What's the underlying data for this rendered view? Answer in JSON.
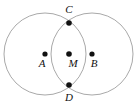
{
  "figure": {
    "background_color": "#ffffff",
    "circle_color": "#a9a9a9",
    "segment_color": "#1a1a1a",
    "point_color": "#111111",
    "width": 138,
    "height": 107
  },
  "points": [
    {
      "id": "A",
      "label": "A",
      "cx": 45,
      "cy": 54,
      "r": 2.6,
      "label_x": 42,
      "label_y": 67
    },
    {
      "id": "M",
      "label": "M",
      "cx": 69,
      "cy": 54,
      "r": 2.8,
      "label_x": 73,
      "label_y": 67
    },
    {
      "id": "B",
      "label": "B",
      "cx": 92,
      "cy": 54,
      "r": 2.6,
      "label_x": 94,
      "label_y": 67
    },
    {
      "id": "C",
      "label": "C",
      "cx": 69,
      "cy": 23,
      "r": 2.8,
      "label_x": 69,
      "label_y": 13
    },
    {
      "id": "D",
      "label": "D",
      "cx": 69,
      "cy": 85,
      "r": 2.8,
      "label_x": 69,
      "label_y": 101
    }
  ],
  "circles": [
    {
      "id": "circle-A",
      "name": "circle centered at A",
      "cx": 45,
      "cy": 54,
      "r": 41
    },
    {
      "id": "circle-B",
      "name": "circle centered at B",
      "cx": 92,
      "cy": 54,
      "r": 41
    }
  ],
  "segments": [
    {
      "id": "segment-AB",
      "name": "segment A to B",
      "x1": 45,
      "y1": 54,
      "x2": 92,
      "y2": 54
    },
    {
      "id": "segment-CD",
      "name": "segment C to D",
      "x1": 69,
      "y1": 23,
      "x2": 69,
      "y2": 85
    }
  ]
}
